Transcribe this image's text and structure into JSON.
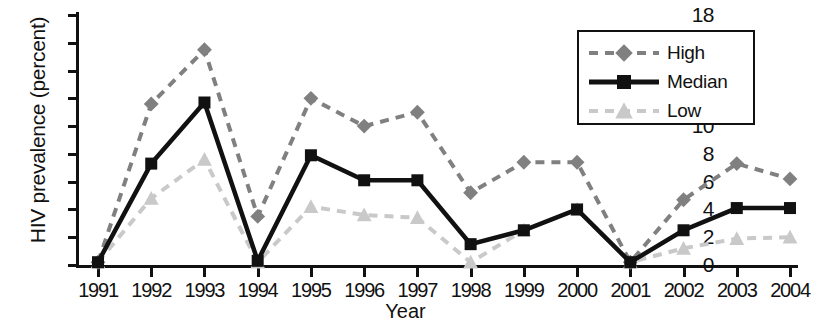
{
  "chart_data": {
    "type": "line",
    "title": "",
    "xlabel": "Year",
    "ylabel": "HIV prevalence (percent)",
    "categories": [
      "1991",
      "1992",
      "1993",
      "1994",
      "1995",
      "1996",
      "1997",
      "1998",
      "1999",
      "2000",
      "2001",
      "2002",
      "2003",
      "2004"
    ],
    "x": [
      1991,
      1992,
      1993,
      1994,
      1995,
      1996,
      1997,
      1998,
      1999,
      2000,
      2001,
      2002,
      2003,
      2004
    ],
    "xlim": [
      1991,
      2004
    ],
    "ylim": [
      0,
      18
    ],
    "yticks": [
      0,
      2,
      4,
      6,
      8,
      10,
      12,
      14,
      16,
      18
    ],
    "ytick_labels": [
      "0",
      "2",
      "4",
      "6",
      "8",
      "10",
      "12",
      "14",
      "16",
      "18"
    ],
    "grid": false,
    "legend_position": "top-right",
    "series": [
      {
        "name": "High",
        "color": "#808080",
        "marker": "diamond",
        "linestyle": "dashed",
        "values": [
          0.2,
          11.6,
          15.5,
          3.5,
          12.0,
          10.0,
          11.0,
          5.2,
          7.4,
          7.4,
          0.2,
          4.7,
          7.3,
          6.2
        ]
      },
      {
        "name": "Median",
        "color": "#111111",
        "marker": "square",
        "linestyle": "solid",
        "values": [
          0.2,
          7.3,
          11.7,
          0.3,
          7.9,
          6.1,
          6.1,
          1.5,
          2.5,
          4.0,
          0.2,
          2.5,
          4.1,
          4.1
        ]
      },
      {
        "name": "Low",
        "color": "#c9c9c9",
        "marker": "triangle",
        "linestyle": "dashed",
        "values": [
          0.2,
          4.8,
          7.6,
          0.2,
          4.2,
          3.6,
          3.4,
          0.2,
          2.5,
          4.0,
          0.2,
          1.2,
          1.9,
          2.0
        ]
      }
    ]
  },
  "legend": {
    "items": [
      {
        "label": "High"
      },
      {
        "label": "Median"
      },
      {
        "label": "Low"
      }
    ]
  }
}
